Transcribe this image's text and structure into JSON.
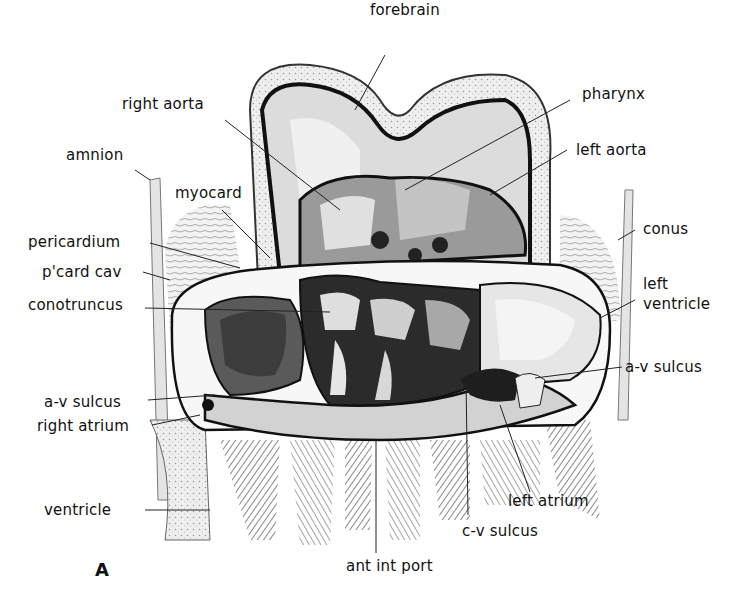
{
  "figure": {
    "panel_letter": "A"
  },
  "labels": [
    {
      "id": "forebrain",
      "text": "forebrain",
      "x": 370,
      "y": 2,
      "line": [
        385,
        55,
        355,
        110
      ]
    },
    {
      "id": "pharynx",
      "text": "pharynx",
      "x": 582,
      "y": 86,
      "line": [
        570,
        100,
        405,
        190
      ]
    },
    {
      "id": "right-aorta",
      "text": "right aorta",
      "x": 122,
      "y": 96,
      "line": [
        225,
        120,
        340,
        210
      ]
    },
    {
      "id": "left-aorta",
      "text": "left aorta",
      "x": 576,
      "y": 142,
      "line": [
        567,
        150,
        490,
        195
      ]
    },
    {
      "id": "amnion",
      "text": "amnion",
      "x": 66,
      "y": 147,
      "line": [
        135,
        170,
        150,
        180
      ]
    },
    {
      "id": "myocard",
      "text": "myocard",
      "x": 175,
      "y": 185,
      "line": [
        222,
        210,
        270,
        258
      ]
    },
    {
      "id": "conus",
      "text": "conus",
      "x": 643,
      "y": 221,
      "line": [
        635,
        230,
        618,
        240
      ]
    },
    {
      "id": "pericardium",
      "text": "pericardium",
      "x": 28,
      "y": 234,
      "line": [
        150,
        243,
        240,
        268
      ]
    },
    {
      "id": "pcard-cav",
      "text": "p'card cav",
      "x": 42,
      "y": 264,
      "line": [
        143,
        272,
        170,
        280
      ]
    },
    {
      "id": "left-ventricle",
      "text": "left\nventricle",
      "x": 643,
      "y": 274,
      "line": [
        635,
        300,
        600,
        318
      ]
    },
    {
      "id": "conotruncus",
      "text": "conotruncus",
      "x": 28,
      "y": 297,
      "line": [
        145,
        308,
        330,
        312
      ]
    },
    {
      "id": "av-sulcus-right",
      "text": "a-v sulcus",
      "x": 625,
      "y": 359,
      "line": [
        622,
        367,
        535,
        378
      ]
    },
    {
      "id": "av-sulcus-left",
      "text": "a-v sulcus",
      "x": 44,
      "y": 394,
      "line": [
        148,
        400,
        215,
        395
      ]
    },
    {
      "id": "right-atrium",
      "text": "right atrium",
      "x": 37,
      "y": 418,
      "line": [
        152,
        425,
        200,
        415
      ]
    },
    {
      "id": "left-atrium",
      "text": "left atrium",
      "x": 508,
      "y": 493,
      "line": [
        530,
        492,
        500,
        405
      ]
    },
    {
      "id": "ventricle",
      "text": "ventricle",
      "x": 44,
      "y": 502,
      "line": [
        145,
        510,
        210,
        510
      ]
    },
    {
      "id": "cv-sulcus",
      "text": "c-v sulcus",
      "x": 462,
      "y": 523,
      "line": [
        468,
        515,
        466,
        380
      ]
    },
    {
      "id": "ant-int-port",
      "text": "ant int port",
      "x": 346,
      "y": 558,
      "line": [
        376,
        553,
        376,
        440
      ]
    }
  ],
  "colors": {
    "ink": "#111111",
    "stipple": "#cfcfcf",
    "dark": "#2a2a2a",
    "mid": "#777777",
    "light": "#e8e8e8",
    "background": "#ffffff"
  }
}
